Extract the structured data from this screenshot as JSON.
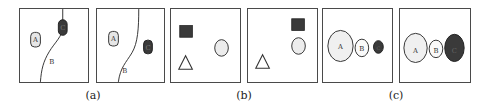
{
  "figure": {
    "groups": [
      {
        "caption": "(a)",
        "panels": [
          {
            "region_a_label": "A",
            "curve_label": "B",
            "region_c_label": "C"
          },
          {
            "region_a_label": "A",
            "curve_label": "B",
            "region_c_label": "C"
          }
        ]
      },
      {
        "caption": "(b)",
        "panels": [
          {
            "shapes": [
              "dark-square",
              "circle",
              "triangle"
            ]
          },
          {
            "shapes": [
              "dark-square",
              "circle",
              "triangle"
            ]
          }
        ]
      },
      {
        "caption": "(c)",
        "panels": [
          {
            "ellipse_labels": [
              "A",
              "B",
              "C"
            ]
          },
          {
            "ellipse_labels": [
              "A",
              "B",
              "C"
            ]
          }
        ]
      }
    ],
    "colors": {
      "frame": "#4a4a4a",
      "light_fill": "#e6e6e6",
      "dark_fill": "#3a3a3a",
      "line": "#333333"
    }
  }
}
